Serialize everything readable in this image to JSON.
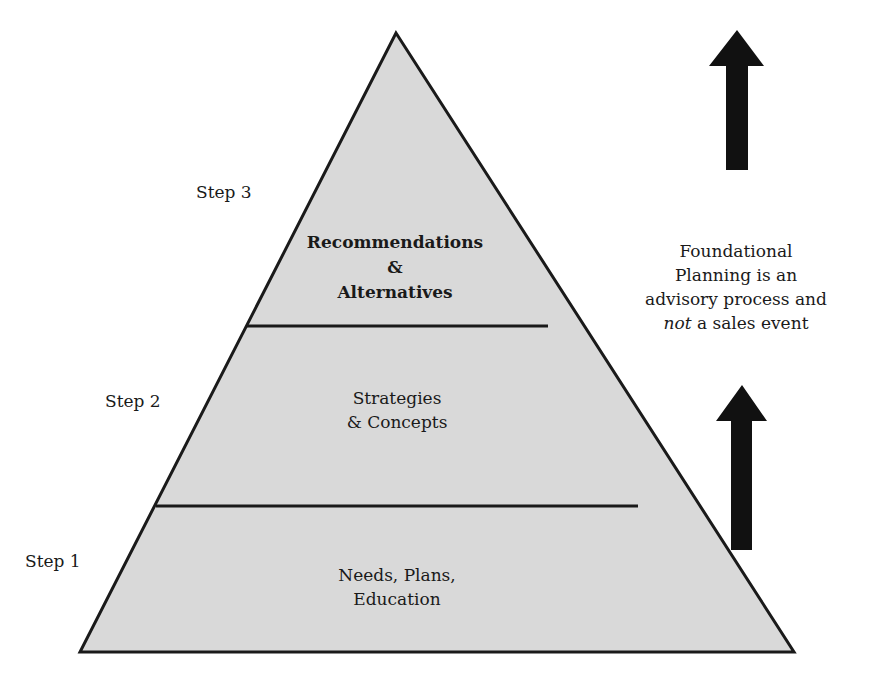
{
  "diagram": {
    "type": "pyramid",
    "fill_color": "#d9d9d9",
    "stroke_color": "#1a1a1a",
    "tiers": [
      {
        "step": "Step 3",
        "lines": [
          "Recommendations",
          "&",
          "Alternatives"
        ],
        "bold": true
      },
      {
        "step": "Step 2",
        "lines": [
          "Strategies",
          "& Concepts"
        ],
        "bold": false
      },
      {
        "step": "Step 1",
        "lines": [
          "Needs, Plans,",
          "Education"
        ],
        "bold": false
      }
    ]
  },
  "side_note": {
    "line1": "Foundational",
    "line2": "Planning is an",
    "line3": "advisory process and",
    "line4_italic": "not",
    "line4_rest": " a sales event"
  },
  "arrows": [
    {
      "name": "upper-arrow",
      "direction": "up"
    },
    {
      "name": "lower-arrow",
      "direction": "up"
    }
  ]
}
